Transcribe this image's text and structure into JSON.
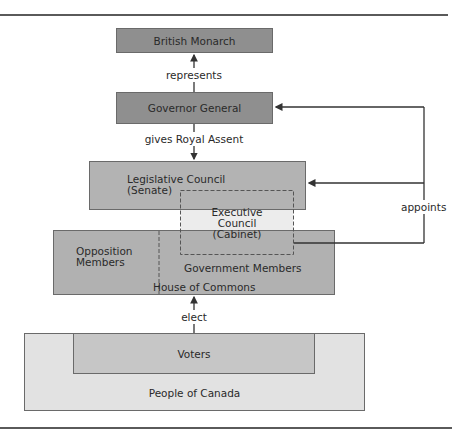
{
  "diagram": {
    "nodes": {
      "monarch": "British Monarch",
      "governor": "Governor General",
      "legislative_line1": "Legislative Council",
      "legislative_line2": "(Senate)",
      "executive_line1": "Executive",
      "executive_line2": "Council",
      "executive_line3": "(Cabinet)",
      "opposition_line1": "Opposition",
      "opposition_line2": "Members",
      "government_members": "Government Members",
      "house": "House of Commons",
      "voters": "Voters",
      "people": "People of Canada"
    },
    "edges": {
      "represents": "represents",
      "royal_assent": "gives Royal Assent",
      "appoints": "appoints",
      "elect": "elect"
    },
    "colors": {
      "dark_box": "#8f8f8f",
      "mid_box": "#b3b3b3",
      "voters_box": "#c6c6c6",
      "people_box": "#e2e2e2",
      "executive_gap": "#ececec"
    }
  }
}
